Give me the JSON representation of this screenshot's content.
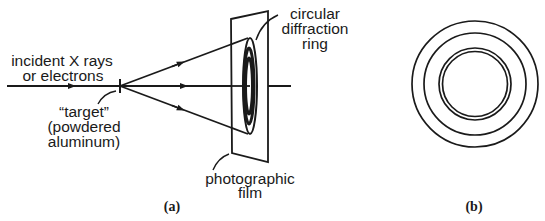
{
  "figure": {
    "panel_a": {
      "caption": "(a)",
      "labels": {
        "incident_line1": "incident X rays",
        "incident_line2": "or electrons",
        "target_line1": "“target”",
        "target_line2": "(powdered",
        "target_line3": "aluminum)",
        "ring_line1": "circular",
        "ring_line2": "diffraction",
        "ring_line3": "ring",
        "film_line1": "photographic",
        "film_line2": "film"
      }
    },
    "panel_b": {
      "caption": "(b)",
      "rings": 4
    },
    "colors": {
      "stroke": "#1a1a1a",
      "background": "#ffffff"
    }
  }
}
